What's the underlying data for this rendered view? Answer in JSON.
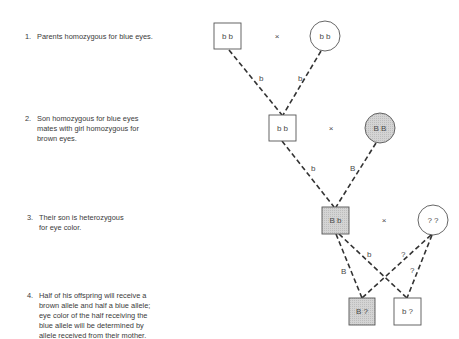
{
  "steps": [
    {
      "number": "1.",
      "lines": [
        "Parents homozygous for blue eyes."
      ]
    },
    {
      "number": "2.",
      "lines": [
        "Son homozygous for blue eyes",
        "mates with girl homozygous for",
        "brown eyes."
      ]
    },
    {
      "number": "3.",
      "lines": [
        "Their son is heterozygous",
        "for eye color."
      ]
    },
    {
      "number": "4.",
      "lines": [
        "Half of his offspring will receive a",
        "brown allele and half a blue allele;",
        "eye color of the half receiving the",
        "blue allele will be determined by",
        "allele received from their mother."
      ]
    }
  ],
  "pedigree": {
    "cross_symbol": "×",
    "gen1": {
      "male": "b b",
      "female": "b b",
      "male_allele": "b",
      "female_allele": "b"
    },
    "gen2": {
      "male": "b b",
      "female": "B B",
      "male_allele": "b",
      "female_allele": "B"
    },
    "gen3": {
      "male": "B b",
      "female": "? ?",
      "male_allele_left": "B",
      "male_allele_right": "b",
      "female_allele_left": "?",
      "female_allele_right": "?"
    },
    "offspring": [
      {
        "genotype": "B ?"
      },
      {
        "genotype": "b ?"
      }
    ]
  },
  "colors": {
    "line": "#333333",
    "shade": "#d9d9d9",
    "border": "#555555"
  }
}
